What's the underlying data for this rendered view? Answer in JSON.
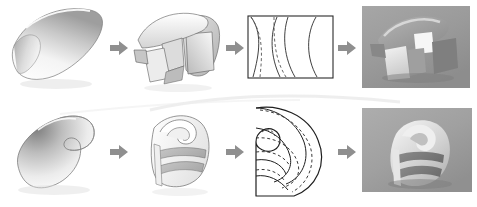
{
  "figure": {
    "background_color": "#ffffff",
    "width": 477,
    "height": 207
  },
  "arrows": {
    "glyph": "right-arrow",
    "color": "#8f8f8f",
    "count": 6,
    "items": [
      {
        "name": "arrow-top-1",
        "from": "surface",
        "to": "segmented"
      },
      {
        "name": "arrow-top-2",
        "from": "segmented",
        "to": "unrolled-pattern"
      },
      {
        "name": "arrow-top-3",
        "from": "unrolled-pattern",
        "to": "photograph"
      },
      {
        "name": "arrow-bottom-1",
        "from": "surface",
        "to": "segmented"
      },
      {
        "name": "arrow-bottom-2",
        "from": "segmented",
        "to": "unrolled-pattern"
      },
      {
        "name": "arrow-bottom-3",
        "from": "unrolled-pattern",
        "to": "photograph"
      }
    ]
  },
  "rows": [
    {
      "id": "row-top",
      "label": "Barrel vault study",
      "stages": [
        {
          "id": "top-surface",
          "kind": "shaded-surface",
          "label": "Smooth curved barrel surface",
          "fill_light": "#ffffff",
          "fill_dark": "#9c9c9c",
          "outline": "#6e6e6e"
        },
        {
          "id": "top-segmented",
          "kind": "segmented-model",
          "label": "Barrel surface cut into folded strips",
          "fill_light": "#fbfbfb",
          "fill_dark": "#b2b2b2",
          "outline": "#5c5c5c"
        },
        {
          "id": "top-pattern",
          "kind": "flat-pattern",
          "label": "Unrolled flat pattern in rectangular sheet",
          "frame_color": "#2a2a2a",
          "solid_curve_color": "#2a2a2a",
          "dashed_curve_color": "#555555",
          "solid_curves": 3,
          "dashed_curves": 2,
          "frame_width": 85,
          "frame_height": 62
        },
        {
          "id": "top-photo",
          "kind": "photograph",
          "label": "Photograph of constructed paper model",
          "background_color": "#9a9a9a",
          "highlight_color": "#f2f2f2",
          "shadow_color": "#6a6a6a"
        }
      ]
    },
    {
      "id": "row-bottom",
      "label": "Spiral shell study",
      "stages": [
        {
          "id": "bottom-surface",
          "kind": "shaded-surface",
          "label": "Smooth spiral teardrop surface",
          "fill_light": "#ffffff",
          "fill_dark": "#8e8e8e",
          "outline": "#6e6e6e"
        },
        {
          "id": "bottom-segmented",
          "kind": "segmented-model",
          "label": "Spiral surface banded into ruled strips",
          "fill_light": "#fcfcfc",
          "fill_dark": "#bdbdbd",
          "outline": "#6a6a6a"
        },
        {
          "id": "bottom-pattern",
          "kind": "flat-pattern",
          "label": "Unrolled spiral pattern with dashed fold lines",
          "frame_color": "#1f1f1f",
          "solid_curve_color": "#1f1f1f",
          "dashed_curve_color": "#3a3a3a",
          "solid_curves": 5,
          "dashed_curves": 4
        },
        {
          "id": "bottom-photo",
          "kind": "photograph",
          "label": "Photograph of constructed spiral paper model",
          "background_color": "#a2a2a2",
          "highlight_color": "#f4f4f4",
          "shadow_color": "#757575"
        }
      ]
    }
  ]
}
